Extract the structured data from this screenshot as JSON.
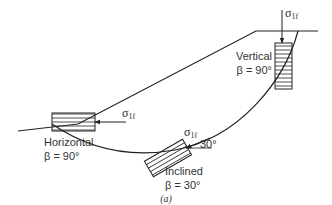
{
  "diagram": {
    "caption": "(a)",
    "stress_symbol": "σ",
    "stress_subscript": "1f",
    "elements": [
      {
        "id": "vertical",
        "label": "Vertical",
        "beta": "β = 90°"
      },
      {
        "id": "horizontal",
        "label": "Horizontal",
        "beta": "β = 90°"
      },
      {
        "id": "inclined",
        "label": "Inclined",
        "beta": "β = 30°",
        "angle_label": "30°"
      }
    ],
    "colors": {
      "line": "#222222",
      "text": "#333333",
      "background": "#ffffff"
    }
  }
}
